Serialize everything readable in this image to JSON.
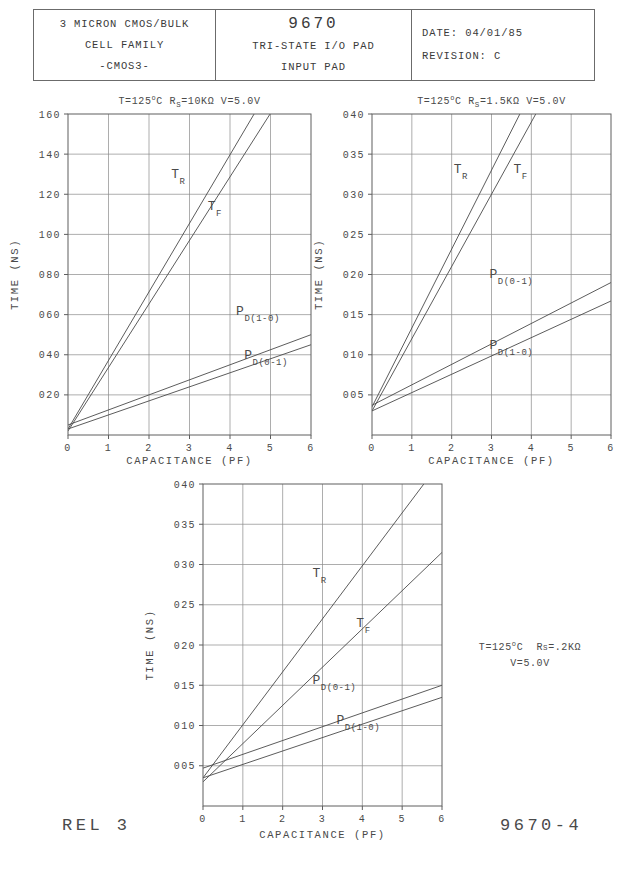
{
  "title_block": {
    "left": {
      "line1": "3 MICRON CMOS/BULK",
      "line2": "CELL FAMILY",
      "line3": "-CMOS3-"
    },
    "middle": {
      "part_number": "9670",
      "line2": "TRI-STATE I/O PAD",
      "line3": "INPUT PAD"
    },
    "right": {
      "date_label": "DATE:",
      "date_value": "04/01/85",
      "revision_label": "REVISION:",
      "revision_value": "C"
    }
  },
  "footer": {
    "left": "REL 3",
    "right": "9670-4"
  },
  "side_note": {
    "line1_pre": "T=125",
    "line1_deg": "o",
    "line1_mid": "C  R",
    "line1_sub": "S",
    "line1_post": "=.2KΩ",
    "line2": "V=5.0V"
  },
  "chart_data": [
    {
      "id": "chart-rs-10k",
      "type": "line",
      "title": "T=125°C  Rₛ=10KΩ  V=5.0V",
      "cond_pre": "T=125",
      "cond_deg": "o",
      "cond_mid": "C  R",
      "cond_sub": "S",
      "cond_post": "=10KΩ  V=5.0V",
      "xlabel": "CAPACITANCE (PF)",
      "ylabel": "TIME (NS)",
      "xlim": [
        0,
        6
      ],
      "ylim": [
        0,
        160
      ],
      "xticks": [
        "0",
        "1",
        "2",
        "3",
        "4",
        "5",
        "6"
      ],
      "xtickvals": [
        0,
        1,
        2,
        3,
        4,
        5,
        6
      ],
      "yticks": [
        "020",
        "040",
        "060",
        "080",
        "100",
        "120",
        "140",
        "160"
      ],
      "ytickvals": [
        20,
        40,
        60,
        80,
        100,
        120,
        140,
        160
      ],
      "grid": true,
      "series": [
        {
          "name": "T_R",
          "label_main": "T",
          "label_sub": "R",
          "x": [
            0,
            6
          ],
          "y": [
            3,
            208
          ],
          "label_at": [
            2.55,
            128
          ]
        },
        {
          "name": "T_F",
          "label_main": "T",
          "label_sub": "F",
          "x": [
            0,
            6
          ],
          "y": [
            2,
            192
          ],
          "label_at": [
            3.45,
            112
          ]
        },
        {
          "name": "P_D(1-0)",
          "label_main": "P",
          "label_sub": "D(1-0)",
          "x": [
            0,
            6
          ],
          "y": [
            5,
            50
          ],
          "label_at": [
            4.15,
            60
          ]
        },
        {
          "name": "P_D(0-1)",
          "label_main": "P",
          "label_sub": "D(0-1)",
          "x": [
            0,
            6
          ],
          "y": [
            3,
            45
          ],
          "label_at": [
            4.35,
            38
          ]
        }
      ]
    },
    {
      "id": "chart-rs-1p5k",
      "type": "line",
      "title": "T=125°C  Rₛ=1.5KΩ  V=5.0V",
      "cond_pre": "T=125",
      "cond_deg": "o",
      "cond_mid": "C  R",
      "cond_sub": "S",
      "cond_post": "=1.5KΩ  V=5.0V",
      "xlabel": "CAPACITANCE (PF)",
      "ylabel": "TIME (NS)",
      "xlim": [
        0,
        6
      ],
      "ylim": [
        0,
        0.4
      ],
      "xticks": [
        "0",
        "1",
        "2",
        "3",
        "4",
        "5",
        "6"
      ],
      "xtickvals": [
        0,
        1,
        2,
        3,
        4,
        5,
        6
      ],
      "yticks": [
        "005",
        "010",
        "015",
        "020",
        "025",
        "030",
        "035",
        "040"
      ],
      "ytickvals": [
        0.05,
        0.1,
        0.15,
        0.2,
        0.25,
        0.3,
        0.35,
        0.4
      ],
      "grid": true,
      "series": [
        {
          "name": "T_R",
          "label_main": "T",
          "label_sub": "R",
          "x": [
            0,
            6
          ],
          "y": [
            0.035,
            0.625
          ],
          "label_at": [
            2.05,
            0.327
          ]
        },
        {
          "name": "T_F",
          "label_main": "T",
          "label_sub": "F",
          "x": [
            0,
            6
          ],
          "y": [
            0.03,
            0.57
          ],
          "label_at": [
            3.55,
            0.327
          ]
        },
        {
          "name": "P_D(0-1)",
          "label_main": "P",
          "label_sub": "D(0-1)",
          "x": [
            0,
            6
          ],
          "y": [
            0.037,
            0.19
          ],
          "label_at": [
            2.95,
            0.196
          ]
        },
        {
          "name": "P_D(1-0)",
          "label_main": "P",
          "label_sub": "D(1-0)",
          "x": [
            0,
            6
          ],
          "y": [
            0.03,
            0.167
          ],
          "label_at": [
            2.95,
            0.107
          ]
        }
      ]
    },
    {
      "id": "chart-rs-0p2k",
      "type": "line",
      "title": "T=125°C  Rₛ=.2KΩ  V=5.0V",
      "cond_pre": "",
      "cond_deg": "",
      "cond_mid": "",
      "cond_sub": "",
      "cond_post": "",
      "xlabel": "CAPACITANCE (PF)",
      "ylabel": "TIME (NS)",
      "xlim": [
        0,
        6
      ],
      "ylim": [
        0,
        0.4
      ],
      "xticks": [
        "0",
        "1",
        "2",
        "3",
        "4",
        "5",
        "6"
      ],
      "xtickvals": [
        0,
        1,
        2,
        3,
        4,
        5,
        6
      ],
      "yticks": [
        "005",
        "010",
        "015",
        "020",
        "025",
        "030",
        "035",
        "040"
      ],
      "ytickvals": [
        0.05,
        0.1,
        0.15,
        0.2,
        0.25,
        0.3,
        0.35,
        0.4
      ],
      "grid": true,
      "series": [
        {
          "name": "T_R",
          "label_main": "T",
          "label_sub": "R",
          "x": [
            0,
            6
          ],
          "y": [
            0.035,
            0.43
          ],
          "label_at": [
            2.75,
            0.285
          ]
        },
        {
          "name": "T_F",
          "label_main": "T",
          "label_sub": "F",
          "x": [
            0,
            6
          ],
          "y": [
            0.03,
            0.315
          ],
          "label_at": [
            3.85,
            0.222
          ]
        },
        {
          "name": "P_D(0-1)",
          "label_main": "P",
          "label_sub": "D(0-1)",
          "x": [
            0,
            6
          ],
          "y": [
            0.047,
            0.15
          ],
          "label_at": [
            2.75,
            0.151
          ]
        },
        {
          "name": "P_D(1-0)",
          "label_main": "P",
          "label_sub": "D(1-0)",
          "x": [
            0,
            6
          ],
          "y": [
            0.035,
            0.135
          ],
          "label_at": [
            3.35,
            0.102
          ]
        }
      ]
    }
  ]
}
